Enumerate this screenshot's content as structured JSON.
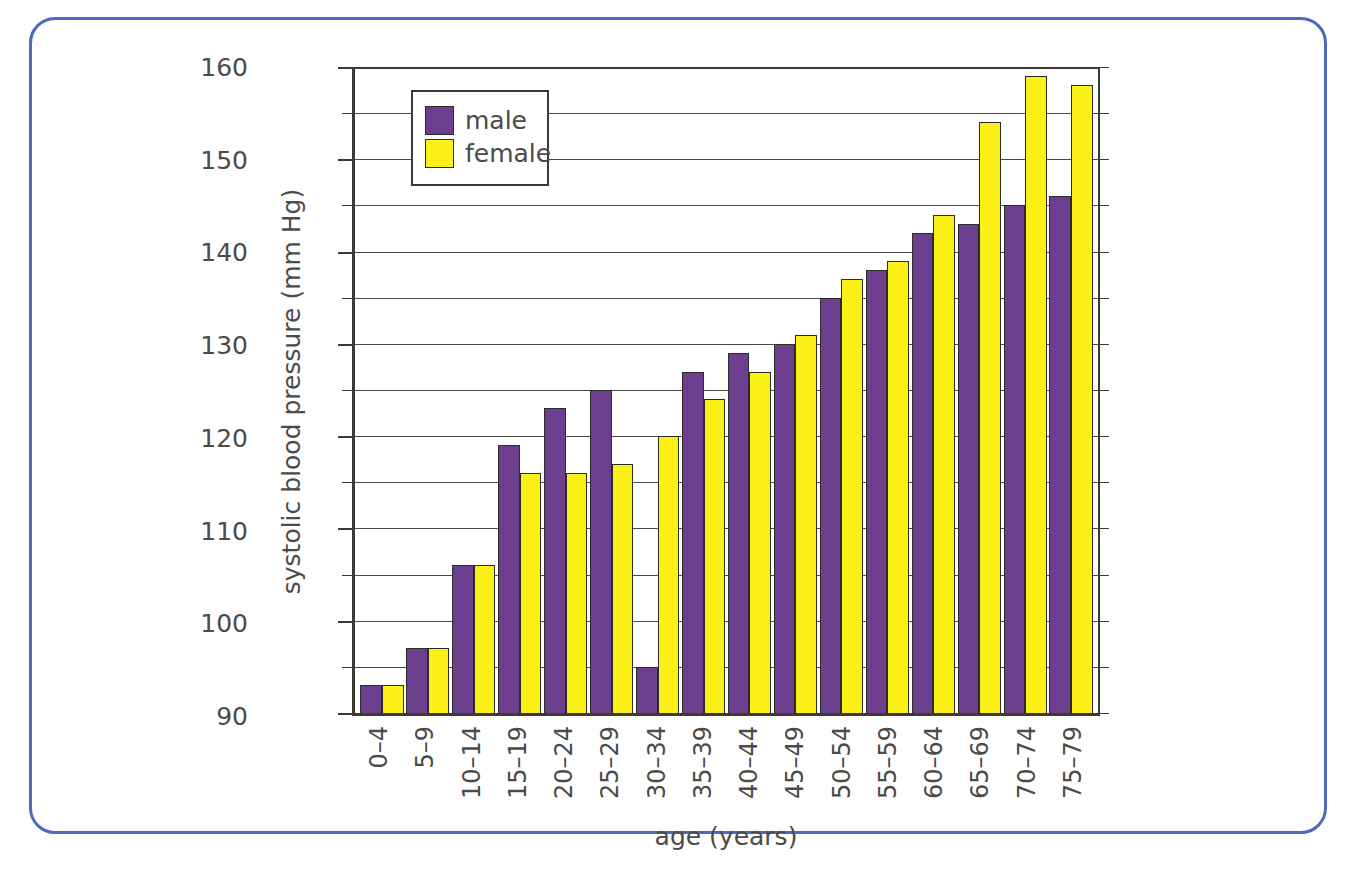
{
  "frame": {
    "border_color": "#4a6bc0"
  },
  "legend": {
    "position": "top-left-inside",
    "entries": [
      {
        "label": "male",
        "color": "#6b3e8e",
        "icon": "legend-swatch-male"
      },
      {
        "label": "female",
        "color": "#faf016",
        "icon": "legend-swatch-female"
      }
    ]
  },
  "axis": {
    "y_tick_labels": [
      "160",
      "150",
      "140",
      "130",
      "120",
      "110",
      "100",
      "90"
    ],
    "y_minor_values": [
      155,
      145,
      135,
      125,
      115,
      105,
      95
    ]
  },
  "chart_data": {
    "type": "bar",
    "title": "",
    "xlabel": "age (years)",
    "ylabel": "systolic blood pressure (mm Hg)",
    "ylim": [
      90,
      160
    ],
    "ytick_step": 10,
    "gridline_step": 5,
    "grid": true,
    "legend_position": "upper left",
    "categories": [
      "0–4",
      "5–9",
      "10–14",
      "15–19",
      "20–24",
      "25–29",
      "30–34",
      "35–39",
      "40–44",
      "45–49",
      "50–54",
      "55–59",
      "60–64",
      "65–69",
      "70–74",
      "75–79"
    ],
    "series": [
      {
        "name": "male",
        "color": "#6b3e8e",
        "values": [
          93,
          97,
          106,
          119,
          123,
          125,
          95,
          127,
          129,
          130,
          135,
          138,
          142,
          143,
          145,
          146
        ]
      },
      {
        "name": "female",
        "color": "#faf016",
        "values": [
          93,
          97,
          106,
          116,
          116,
          117,
          120,
          124,
          127,
          131,
          137,
          139,
          144,
          154,
          159,
          158
        ]
      }
    ]
  }
}
